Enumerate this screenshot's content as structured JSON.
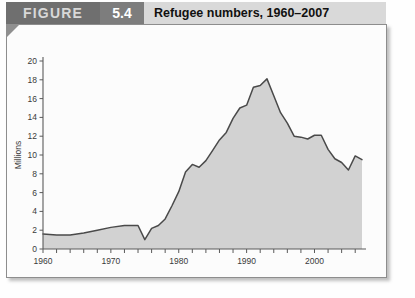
{
  "header": {
    "figure_label": "FIGURE",
    "figure_number": "5.4",
    "title": "Refugee numbers, 1960–2007",
    "figure_bg": "#6f6f6f",
    "number_bg": "#7d7d7d",
    "title_bg": "#d9d9d9"
  },
  "chart_data": {
    "type": "area",
    "title": "Refugee numbers, 1960–2007",
    "xlabel": "",
    "ylabel": "Millions",
    "xlim": [
      1960,
      2007
    ],
    "ylim": [
      0,
      20
    ],
    "ytick_step": 2,
    "xtick_step": 2,
    "grid": false,
    "legend": "none",
    "yticks": [
      0,
      2,
      4,
      6,
      8,
      10,
      12,
      14,
      16,
      18,
      20
    ],
    "ytick_labels": [
      "0",
      "2",
      "4",
      "6",
      "8",
      "10",
      "12",
      "14",
      "16",
      "18",
      "20"
    ],
    "xtick_labels": [
      "1960",
      "1970",
      "1980",
      "1990",
      "2000"
    ],
    "xtick_label_values": [
      1960,
      1970,
      1980,
      1990,
      2000
    ],
    "series": [
      {
        "name": "Refugees",
        "fill_color": "#d2d2d2",
        "line_color": "#4a4a4a",
        "x": [
          1960,
          1962,
          1964,
          1966,
          1968,
          1970,
          1972,
          1974,
          1975,
          1976,
          1977,
          1978,
          1979,
          1980,
          1981,
          1982,
          1983,
          1984,
          1985,
          1986,
          1987,
          1988,
          1989,
          1990,
          1991,
          1992,
          1993,
          1994,
          1995,
          1996,
          1997,
          1998,
          1999,
          2000,
          2001,
          2002,
          2003,
          2004,
          2005,
          2006,
          2007
        ],
        "values": [
          1.6,
          1.5,
          1.5,
          1.7,
          2.0,
          2.3,
          2.5,
          2.5,
          1.0,
          2.2,
          2.5,
          3.2,
          4.6,
          6.1,
          8.2,
          9.0,
          8.7,
          9.4,
          10.5,
          11.6,
          12.4,
          13.9,
          15.0,
          15.3,
          17.2,
          17.4,
          18.1,
          16.3,
          14.5,
          13.4,
          12.0,
          11.9,
          11.7,
          12.1,
          12.1,
          10.6,
          9.6,
          9.2,
          8.4,
          9.9,
          9.5
        ]
      }
    ]
  }
}
